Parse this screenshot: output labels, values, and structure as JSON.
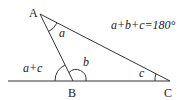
{
  "points": {
    "A": {
      "label": "A"
    },
    "B": {
      "label": "B"
    },
    "C": {
      "label": "C"
    }
  },
  "angles": {
    "at_A": "a",
    "at_B_interior": "b",
    "at_C": "c",
    "exterior_B": "a+c"
  },
  "equation": "a+b+c=180°",
  "colors": {
    "stroke": "#333333",
    "text": "#222222",
    "background": "#ffffff"
  }
}
